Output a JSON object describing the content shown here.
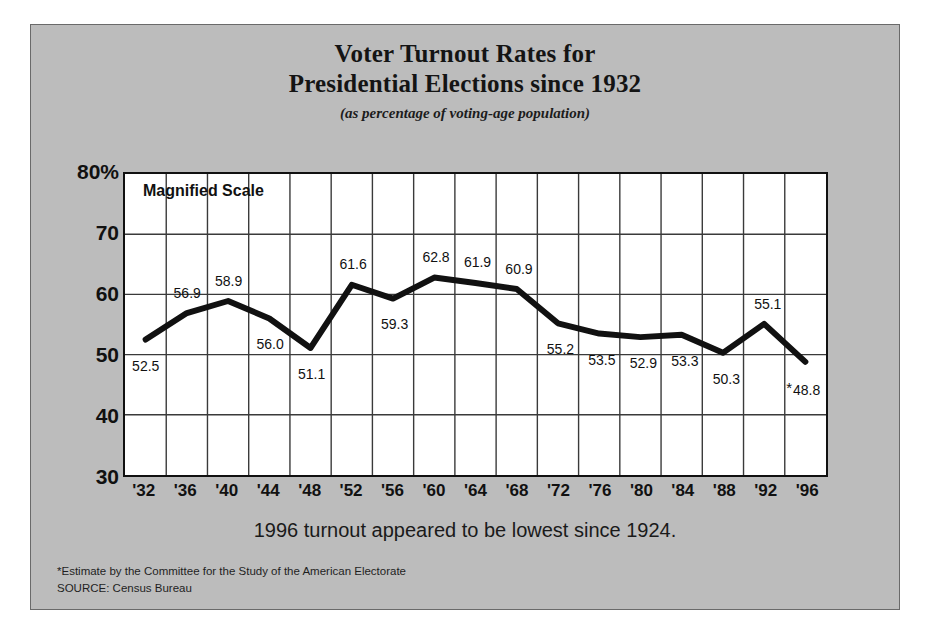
{
  "figure": {
    "title_lines": [
      "Voter Turnout Rates for",
      "Presidential Elections since 1932"
    ],
    "subtitle": "(as percentage of voting-age population)",
    "annotation": "Magnified Scale",
    "caption": "1996 turnout appeared to be lowest since 1924.",
    "footnotes": [
      "*Estimate by the Committee for the Study of the American Electorate",
      "SOURCE: Census Bureau"
    ],
    "colors": {
      "panel_background": "#bcbcbc",
      "plot_background": "#ffffff",
      "line": "#111111",
      "grid": "#3a3a3a",
      "text": "#111111"
    }
  },
  "chart_data": {
    "type": "line",
    "title": "Voter Turnout Rates for Presidential Elections since 1932",
    "subtitle": "(as percentage of voting-age population)",
    "xlabel": "",
    "ylabel": "",
    "categories": [
      "'32",
      "'36",
      "'40",
      "'44",
      "'48",
      "'52",
      "'56",
      "'60",
      "'64",
      "'68",
      "'72",
      "'76",
      "'80",
      "'84",
      "'88",
      "'92",
      "'96"
    ],
    "x_full_years": [
      1932,
      1936,
      1940,
      1944,
      1948,
      1952,
      1956,
      1960,
      1964,
      1968,
      1972,
      1976,
      1980,
      1984,
      1988,
      1992,
      1996
    ],
    "values": [
      52.5,
      56.9,
      58.9,
      56.0,
      51.1,
      61.6,
      59.3,
      62.8,
      61.9,
      60.9,
      55.2,
      53.5,
      52.9,
      53.3,
      50.3,
      55.1,
      48.8
    ],
    "point_labels": [
      "52.5",
      "56.9",
      "58.9",
      "56.0",
      "51.1",
      "61.6",
      "59.3",
      "62.8",
      "61.9",
      "60.9",
      "55.2",
      "53.5",
      "52.9",
      "53.3",
      "50.3",
      "55.1",
      "48.8"
    ],
    "label_positions": [
      "below",
      "above",
      "above",
      "below",
      "below",
      "above",
      "below",
      "above",
      "above",
      "above",
      "below",
      "below",
      "below",
      "below",
      "below",
      "above",
      "below"
    ],
    "estimated_flag_index": 16,
    "estimated_flag_symbol": "*",
    "ylim": [
      30,
      80
    ],
    "ytick_labels": [
      "80%",
      "70",
      "60",
      "50",
      "40",
      "30"
    ],
    "ytick_values": [
      80,
      70,
      60,
      50,
      40,
      30
    ],
    "grid": true,
    "legend": "none",
    "annotations": [
      "Magnified Scale"
    ]
  }
}
